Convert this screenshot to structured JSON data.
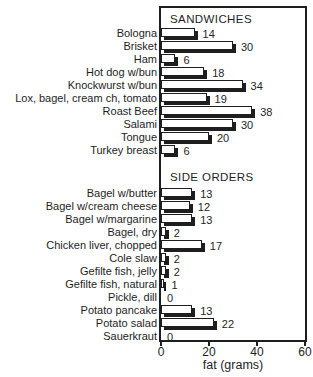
{
  "chart_data": {
    "type": "bar",
    "orientation": "horizontal",
    "title": "",
    "xlabel": "fat (grams)",
    "ylabel": "",
    "xlim": [
      0,
      60
    ],
    "xticks": [
      "0",
      "20",
      "40",
      "60"
    ],
    "grid": false,
    "legend": null,
    "show_value_labels": true,
    "bar_style": "white fill, black outline, black drop shadow offset down-right",
    "groups": [
      {
        "label": "SANDWICHES",
        "items": [
          {
            "label": "Bologna",
            "value": 14
          },
          {
            "label": "Brisket",
            "value": 30
          },
          {
            "label": "Ham",
            "value": 6
          },
          {
            "label": "Hot dog w/bun",
            "value": 18
          },
          {
            "label": "Knockwurst w/bun",
            "value": 34
          },
          {
            "label": "Lox, bagel, cream ch, tomato",
            "value": 19
          },
          {
            "label": "Roast Beef",
            "value": 38
          },
          {
            "label": "Salami",
            "value": 30
          },
          {
            "label": "Tongue",
            "value": 20
          },
          {
            "label": "Turkey breast",
            "value": 6
          }
        ]
      },
      {
        "label": "SIDE ORDERS",
        "items": [
          {
            "label": "Bagel w/butter",
            "value": 13
          },
          {
            "label": "Bagel w/cream cheese",
            "value": 12
          },
          {
            "label": "Bagel w/margarine",
            "value": 13
          },
          {
            "label": "Bagel, dry",
            "value": 2
          },
          {
            "label": "Chicken liver, chopped",
            "value": 17
          },
          {
            "label": "Cole slaw",
            "value": 2
          },
          {
            "label": "Gefilte fish, jelly",
            "value": 2
          },
          {
            "label": "Gefilte fish, natural",
            "value": 1
          },
          {
            "label": "Pickle, dill",
            "value": 0
          },
          {
            "label": "Potato pancake",
            "value": 13
          },
          {
            "label": "Potato salad",
            "value": 22
          },
          {
            "label": "Sauerkraut",
            "value": 0
          }
        ]
      }
    ],
    "colors": {
      "background": "#ffffff",
      "ink": "#1e1e1e",
      "bar_fill": "#ffffff",
      "bar_border": "#1e1e1e",
      "bar_shadow": "#1e1e1e"
    }
  }
}
